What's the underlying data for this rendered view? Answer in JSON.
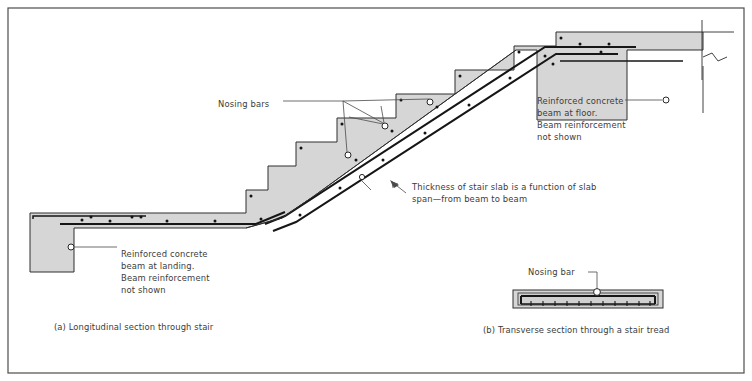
{
  "figure": {
    "colors": {
      "concrete_fill": "#d6d6d6",
      "outline": "#2e2e2e",
      "rebar": "#161616",
      "text": "#3b3b3b",
      "leader": "#4a4a4a",
      "border": "#4d4d4d",
      "background": "#ffffff"
    },
    "border": {
      "x": 8,
      "y": 8,
      "width": 736,
      "height": 365
    }
  },
  "annotations": {
    "nosing_bars": {
      "label": "Nosing bars",
      "x": 218,
      "y": 104
    },
    "thickness_note": {
      "line1": "Thickness of stair slab is a function of slab",
      "line2": "span—from beam to beam",
      "x": 412,
      "y": 187
    },
    "beam_at_floor": {
      "line1": "Reinforced concrete",
      "line2": "beam at floor.",
      "line3": "Beam reinforcement",
      "line4": "not shown",
      "x": 537,
      "y": 104
    },
    "beam_at_landing": {
      "line1": "Reinforced concrete",
      "line2": "beam at landing.",
      "line3": " Beam reinforcement",
      "line4": "not shown",
      "x": 121,
      "y": 257
    },
    "nosing_bar_tread": {
      "label": "Nosing bar",
      "x": 528,
      "y": 270
    }
  },
  "captions": {
    "a": {
      "text": "(a) Longitudinal section through stair",
      "x": 54,
      "y": 330
    },
    "b": {
      "text": "(b) Transverse section through a stair tread",
      "x": 483,
      "y": 333
    }
  },
  "geometry": {
    "stair_outline": "M 30,213 L 30,272 L 74,272 L 74,228 L 246,228 L 246,203 L 268,203 L 268,177 L 296,177 L 296,177 L 296,152 L 337,152 L 337,128 L 396,128 L 396,104 L 455,104 L 455,80 L 514,80 L 514,56 L 556,56 L 556,32 L 703,32 L 703,50 L 703,50 L 627,50 L 627,120 L 537,120 L 537,50 L 556,50",
    "step_count": 6,
    "landing_slab": {
      "left": 30,
      "right": 246,
      "top": 213,
      "bottom": 228
    },
    "landing_beam": {
      "left": 30,
      "right": 74,
      "top": 213,
      "bottom": 272
    },
    "floor_beam": {
      "left": 537,
      "right": 627,
      "top": 50,
      "bottom": 120
    },
    "tread_section": {
      "x": 513,
      "y": 290,
      "width": 150,
      "height": 16
    },
    "tread_stirrup_count": 11
  },
  "bars": {
    "landing_dots_y": 221,
    "landing_dots_x": [
      98,
      114,
      148,
      172,
      205,
      243
    ],
    "nosing_circles": [
      {
        "x": 348,
        "y": 155,
        "r": 3.0
      },
      {
        "x": 385,
        "y": 126,
        "r": 3.0
      },
      {
        "x": 430,
        "y": 102,
        "r": 3.0
      },
      {
        "x": 362,
        "y": 178,
        "r": 2.6
      },
      {
        "x": 665,
        "y": 103,
        "r": 3.0
      },
      {
        "x": 71,
        "y": 240,
        "r": 3.0
      },
      {
        "x": 597,
        "y": 292,
        "r": 3.3
      }
    ],
    "tread_top_dots": [
      358,
      420,
      475,
      530
    ]
  }
}
